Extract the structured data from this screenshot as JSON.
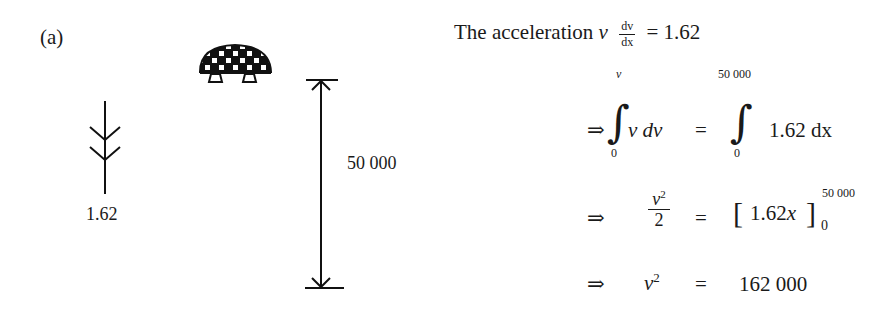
{
  "figure": {
    "label": "(a)",
    "force_label": "1.62",
    "distance_label": "50 000",
    "icons": [
      "lander-icon",
      "double-arrow-icon",
      "distance-dimension-icon"
    ]
  },
  "derivation": {
    "line1": {
      "prefix": "The acceleration",
      "var": "v",
      "frac_num": "dv",
      "frac_den": "dx",
      "rhs": "= 1.62"
    },
    "line2": {
      "implies": "⇒",
      "left_upper": "v",
      "left_lower": "0",
      "left_integrand": "v dv",
      "equals": "=",
      "right_upper": "50 000",
      "right_lower": "0",
      "right_integrand": "1.62 dx"
    },
    "line3": {
      "implies": "⇒",
      "frac_num": "v",
      "frac_num_exp": "2",
      "frac_den": "2",
      "equals": "=",
      "bracket_content": "1.62x",
      "upper": "50 000",
      "lower": "0"
    },
    "line4": {
      "implies": "⇒",
      "lhs": "v",
      "lhs_exp": "2",
      "equals": "=",
      "rhs": "162 000"
    }
  }
}
